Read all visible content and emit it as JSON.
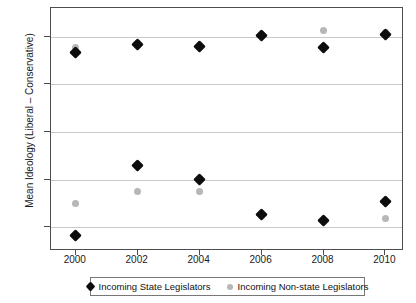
{
  "chart_data": {
    "type": "scatter",
    "title": "",
    "xlabel": "",
    "ylabel": "Mean Ideology (Liberal – Conservative)",
    "x": [
      2000,
      2002,
      2004,
      2006,
      2008,
      2010
    ],
    "xticklabels": [
      "2000",
      "2002",
      "2004",
      "2006",
      "2008",
      "2010"
    ],
    "yticklabels": [
      "1",
      "0.5",
      "0",
      "–0.5",
      "–1"
    ],
    "ytickvalues": [
      1,
      0.5,
      0,
      -0.5,
      -1
    ],
    "xlim": [
      1999.2,
      2010.6
    ],
    "ylim": [
      -1.25,
      1.3
    ],
    "grid": "horizontal",
    "legend_position": "bottom",
    "series": [
      {
        "name": "Incoming State Legislators",
        "marker": "diamond",
        "color": "#0d0d0d",
        "groups": [
          {
            "label": "upper",
            "values": [
              0.83,
              0.92,
              0.9,
              1.01,
              0.89,
              1.02
            ]
          },
          {
            "label": "lower",
            "values": [
              -1.09,
              -0.35,
              -0.5,
              -0.87,
              -0.93,
              -0.73
            ]
          }
        ]
      },
      {
        "name": "Incoming Non-state Legislators",
        "marker": "circle",
        "color": "#b7b7b7",
        "groups": [
          {
            "label": "upper",
            "values": [
              0.89,
              0.93,
              0.91,
              1.02,
              1.06,
              1.04
            ]
          },
          {
            "label": "lower",
            "values": [
              -0.75,
              -0.62,
              -0.63,
              -0.88,
              -0.94,
              -0.91
            ]
          }
        ]
      }
    ]
  },
  "legend": {
    "items": [
      {
        "label": "Incoming State Legislators",
        "marker": "diamond",
        "color": "#0d0d0d"
      },
      {
        "label": "Incoming Non-state Legislators",
        "marker": "circle",
        "color": "#b7b7b7"
      }
    ]
  },
  "colors": {
    "state_legislators": "#0d0d0d",
    "non_state_legislators": "#b7b7b7",
    "gridline": "#c9c9c9",
    "axis": "#4d4d4d"
  }
}
